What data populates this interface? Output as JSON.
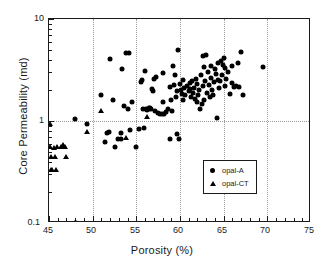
{
  "chart_data": {
    "type": "scatter",
    "title": "",
    "xlabel": "Porosity (%)",
    "ylabel": "Core Permeability (md)",
    "xlim": [
      45,
      75
    ],
    "ylim": [
      0.1,
      10
    ],
    "yscale": "log",
    "xscale": "linear",
    "xticks": [
      45,
      50,
      55,
      60,
      65,
      70,
      75
    ],
    "xtick_labels": [
      "45",
      "50",
      "55",
      "60",
      "65",
      "70",
      "75"
    ],
    "yticks": [
      0.1,
      1,
      10
    ],
    "ytick_labels": [
      "0.1",
      "1",
      "10"
    ],
    "grid": {
      "vertical": true,
      "horizontal": true,
      "style": "dotted",
      "color": "#9a9a9a"
    },
    "legend": {
      "position": "lower-right",
      "entries": [
        {
          "label": "opal-A",
          "marker": "circle",
          "color": "#000000"
        },
        {
          "label": "opal-CT",
          "marker": "triangle",
          "color": "#000000"
        }
      ]
    },
    "series": [
      {
        "name": "opal-A",
        "marker": "circle",
        "color": "#000000",
        "points": [
          [
            48.1,
            0.1
          ],
          [
            48.0,
            1.05
          ],
          [
            49.4,
            0.93
          ],
          [
            50.9,
            1.78
          ],
          [
            51.4,
            0.62
          ],
          [
            51.6,
            0.76
          ],
          [
            51.9,
            0.78
          ],
          [
            52.0,
            4.05
          ],
          [
            52.3,
            1.62
          ],
          [
            52.5,
            0.56
          ],
          [
            52.9,
            0.67
          ],
          [
            53.2,
            0.67
          ],
          [
            53.3,
            0.76
          ],
          [
            53.4,
            3.25
          ],
          [
            53.6,
            1.4
          ],
          [
            53.8,
            4.6
          ],
          [
            54.0,
            1.3
          ],
          [
            54.2,
            4.65
          ],
          [
            54.3,
            0.82
          ],
          [
            54.5,
            1.52
          ],
          [
            55.0,
            0.56
          ],
          [
            55.3,
            0.84
          ],
          [
            55.6,
            2.55
          ],
          [
            55.8,
            1.3
          ],
          [
            55.9,
            0.85
          ],
          [
            56.0,
            3.1
          ],
          [
            56.1,
            1.32
          ],
          [
            56.2,
            1.28
          ],
          [
            56.4,
            1.35
          ],
          [
            56.5,
            1.3
          ],
          [
            56.6,
            1.33
          ],
          [
            56.7,
            1.3
          ],
          [
            56.8,
            2.05
          ],
          [
            56.9,
            1.95
          ],
          [
            57.1,
            1.26
          ],
          [
            57.3,
            2.7
          ],
          [
            57.5,
            1.2
          ],
          [
            57.7,
            1.16
          ],
          [
            57.9,
            1.18
          ],
          [
            58.0,
            2.95
          ],
          [
            58.1,
            1.55
          ],
          [
            58.2,
            1.18
          ],
          [
            58.4,
            1.22
          ],
          [
            58.6,
            1.3
          ],
          [
            58.8,
            2.15
          ],
          [
            58.9,
            0.66
          ],
          [
            59.0,
            1.62
          ],
          [
            59.1,
            1.25
          ],
          [
            59.3,
            2.25
          ],
          [
            59.4,
            2.8
          ],
          [
            59.5,
            1.7
          ],
          [
            59.6,
            0.74
          ],
          [
            59.7,
            1.95
          ],
          [
            59.8,
            5.0
          ],
          [
            59.9,
            0.66
          ],
          [
            60.0,
            2.3
          ],
          [
            60.1,
            2.0
          ],
          [
            60.2,
            1.85
          ],
          [
            60.3,
            2.55
          ],
          [
            60.4,
            1.62
          ],
          [
            60.5,
            2.1
          ],
          [
            60.6,
            1.78
          ],
          [
            60.8,
            2.2
          ],
          [
            61.0,
            1.95
          ],
          [
            61.1,
            2.35
          ],
          [
            61.2,
            2.05
          ],
          [
            61.3,
            1.72
          ],
          [
            61.4,
            2.45
          ],
          [
            61.5,
            1.88
          ],
          [
            61.6,
            2.12
          ],
          [
            61.7,
            1.64
          ],
          [
            61.8,
            2.6
          ],
          [
            61.9,
            1.55
          ],
          [
            62.0,
            2.3
          ],
          [
            62.1,
            1.8
          ],
          [
            62.2,
            2.0
          ],
          [
            62.3,
            1.3
          ],
          [
            62.4,
            2.8
          ],
          [
            62.5,
            1.46
          ],
          [
            62.6,
            2.18
          ],
          [
            62.7,
            3.35
          ],
          [
            62.8,
            1.62
          ],
          [
            62.9,
            2.45
          ],
          [
            63.0,
            4.4
          ],
          [
            63.1,
            1.9
          ],
          [
            63.2,
            3.05
          ],
          [
            63.3,
            2.25
          ],
          [
            63.4,
            1.72
          ],
          [
            63.5,
            3.5
          ],
          [
            63.6,
            2.62
          ],
          [
            63.7,
            2.0
          ],
          [
            63.8,
            1.8
          ],
          [
            63.9,
            2.4
          ],
          [
            64.0,
            3.2
          ],
          [
            64.1,
            2.9
          ],
          [
            64.2,
            1.06
          ],
          [
            64.3,
            2.55
          ],
          [
            64.4,
            3.7
          ],
          [
            64.5,
            2.1
          ],
          [
            64.6,
            2.45
          ],
          [
            64.7,
            3.85
          ],
          [
            64.8,
            2.85
          ],
          [
            64.9,
            3.55
          ],
          [
            65.0,
            4.1
          ],
          [
            65.1,
            2.2
          ],
          [
            65.2,
            3.3
          ],
          [
            65.3,
            2.6
          ],
          [
            65.5,
            3.0
          ],
          [
            65.7,
            1.85
          ],
          [
            65.9,
            2.35
          ],
          [
            66.0,
            3.45
          ],
          [
            66.2,
            2.15
          ],
          [
            66.4,
            2.2
          ],
          [
            66.6,
            3.7
          ],
          [
            66.8,
            2.15
          ],
          [
            67.0,
            4.75
          ],
          [
            67.2,
            1.8
          ],
          [
            69.5,
            3.35
          ],
          [
            62.6,
            4.35
          ],
          [
            59.2,
            3.45
          ],
          [
            57.0,
            2.6
          ],
          [
            55.5,
            2.4
          ]
        ]
      },
      {
        "name": "opal-CT",
        "marker": "triangle",
        "color": "#000000",
        "points": [
          [
            45.1,
            0.94
          ],
          [
            45.1,
            0.55
          ],
          [
            45.2,
            0.44
          ],
          [
            45.2,
            0.33
          ],
          [
            45.4,
            0.33
          ],
          [
            45.6,
            0.54
          ],
          [
            45.7,
            0.44
          ],
          [
            45.8,
            0.33
          ],
          [
            45.9,
            0.55
          ],
          [
            46.4,
            0.55
          ],
          [
            46.6,
            0.58
          ],
          [
            46.8,
            0.55
          ],
          [
            46.9,
            0.44
          ],
          [
            48.0,
            0.1
          ],
          [
            49.3,
            0.78
          ],
          [
            50.9,
            1.26
          ],
          [
            53.8,
            0.68
          ],
          [
            56.2,
            1.1
          ]
        ]
      }
    ]
  },
  "axes": {
    "x_title": "Porosity (%)",
    "y_title": "Core Permeability (md)",
    "x_tick_labels": [
      "45",
      "50",
      "55",
      "60",
      "65",
      "70",
      "75"
    ],
    "y_tick_labels": [
      "10",
      "1",
      "0.1"
    ]
  },
  "legend": {
    "items": [
      {
        "label": "opal-A"
      },
      {
        "label": "opal-CT"
      }
    ]
  }
}
